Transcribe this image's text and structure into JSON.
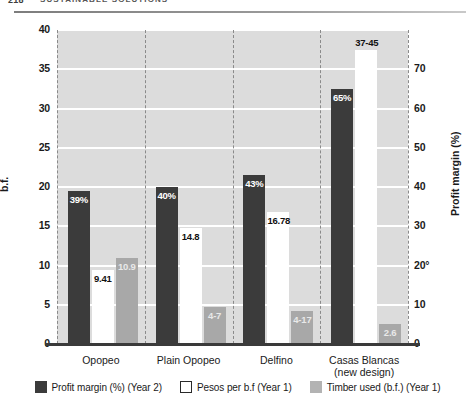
{
  "page_header": {
    "folio": "218",
    "running_title": "SUSTAINABLE SOLUTIONS"
  },
  "chart_data": {
    "type": "bar",
    "title": "",
    "subtitle": "",
    "categories": [
      "Opopeo",
      "Plain Opopeo",
      "Delfino",
      "Casas Blancas"
    ],
    "category_sublabels": [
      "",
      "",
      "",
      "(new design)"
    ],
    "xlabel": "",
    "ylabel": "b.f.",
    "ylabel_right": "Profit margin (%)",
    "ylim": [
      0,
      40
    ],
    "ylim_right": [
      0,
      80
    ],
    "yticks": [
      0,
      5,
      10,
      15,
      20,
      25,
      30,
      35,
      40
    ],
    "ytick_labels": [
      "0",
      "5",
      "10",
      "15",
      "20",
      "25",
      "30",
      "35",
      "40"
    ],
    "yticks_right": [
      0,
      10,
      20,
      30,
      40,
      50,
      60,
      70
    ],
    "ytick_labels_right": [
      "0",
      "10",
      "20°",
      "30",
      "40",
      "50",
      "60",
      "70"
    ],
    "grid": true,
    "legend_position": "bottom",
    "series": [
      {
        "name": "Profit margin (%) (Year 2)",
        "axis": "right",
        "color": "#3b3b3b",
        "values": [
          39,
          40,
          43,
          65
        ],
        "labels": [
          "39%",
          "40%",
          "43%",
          "65%"
        ],
        "label_placement": [
          "inside",
          "inside",
          "inside",
          "inside"
        ]
      },
      {
        "name": "Pesos per b.f (Year 1)",
        "axis": "left",
        "color": "#ffffff",
        "values": [
          9.41,
          14.8,
          16.78,
          37.45
        ],
        "labels": [
          "9.41",
          "14.8",
          "16.78",
          "37-45"
        ],
        "label_placement": [
          "inside",
          "inside",
          "inside",
          "above"
        ]
      },
      {
        "name": "Timber used (b.f.) (Year 1)",
        "axis": "left",
        "color": "#a8a8a8",
        "values": [
          10.9,
          4.7,
          4.17,
          2.6
        ],
        "labels": [
          "10.9",
          "4-7",
          "4-17",
          "2.6"
        ],
        "label_placement": [
          "inside",
          "inside",
          "inside",
          "inside"
        ]
      }
    ]
  },
  "legend": {
    "items": [
      {
        "label": "Profit margin (%) (Year 2)",
        "swatch": "dark"
      },
      {
        "label": "Pesos per b.f (Year 1)",
        "swatch": "white"
      },
      {
        "label": "Timber used (b.f.) (Year 1)",
        "swatch": "gray"
      }
    ]
  }
}
